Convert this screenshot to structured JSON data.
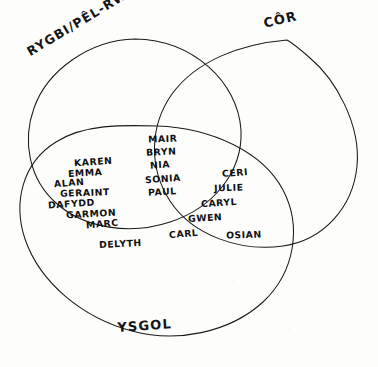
{
  "diagram": {
    "type": "venn-3-set",
    "style": "hand-drawn pen on paper",
    "language": "Welsh",
    "ink_color": "#141414",
    "paper_color": "#fdfdfc"
  },
  "sets": {
    "rugby_netball": {
      "label": "RYGBI/PÊL-RWYD",
      "position": "top-left",
      "rotation_deg": -31
    },
    "choir": {
      "label": "CÔR",
      "position": "top-right",
      "rotation_deg": -13
    },
    "school": {
      "label": "YSGOL",
      "position": "bottom",
      "rotation_deg": -4
    }
  },
  "regions": [
    {
      "id": "rugby-and-school",
      "name": "RYGBI/PÊL-RWYD ∩ YSGOL",
      "members": [
        {
          "name": "KAREN",
          "x": 74,
          "y": 156
        },
        {
          "name": "EMMA",
          "x": 68,
          "y": 167
        },
        {
          "name": "ALAN",
          "x": 54,
          "y": 177
        },
        {
          "name": "GERAINT",
          "x": 60,
          "y": 187
        },
        {
          "name": "DAFYDD",
          "x": 48,
          "y": 198
        },
        {
          "name": "GARMON",
          "x": 66,
          "y": 208
        },
        {
          "name": "MARC",
          "x": 86,
          "y": 218
        }
      ]
    },
    {
      "id": "all-three",
      "name": "RYGBI/PÊL-RWYD ∩ CÔR ∩ YSGOL",
      "members": [
        {
          "name": "MAIR",
          "x": 148,
          "y": 133
        },
        {
          "name": "BRYN",
          "x": 146,
          "y": 146
        },
        {
          "name": "NIA",
          "x": 150,
          "y": 159
        },
        {
          "name": "SONIA",
          "x": 145,
          "y": 173
        },
        {
          "name": "PAUL",
          "x": 148,
          "y": 186
        }
      ]
    },
    {
      "id": "choir-and-school",
      "name": "CÔR ∩ YSGOL",
      "members": [
        {
          "name": "CERI",
          "x": 222,
          "y": 167
        },
        {
          "name": "JULIE",
          "x": 214,
          "y": 182
        },
        {
          "name": "CARYL",
          "x": 201,
          "y": 197
        },
        {
          "name": "GWEN",
          "x": 188,
          "y": 212
        },
        {
          "name": "CARL",
          "x": 169,
          "y": 228
        }
      ]
    },
    {
      "id": "choir-only",
      "name": "CÔR yn unig",
      "members": [
        {
          "name": "OSIAN",
          "x": 226,
          "y": 229
        }
      ]
    },
    {
      "id": "school-only",
      "name": "YSGOL yn unig",
      "members": [
        {
          "name": "DELYTH",
          "x": 99,
          "y": 238
        }
      ]
    }
  ]
}
